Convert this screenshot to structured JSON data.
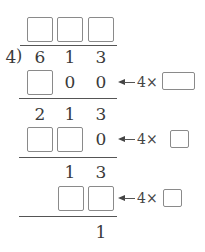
{
  "divisor": "4",
  "dividend": [
    "6",
    "1",
    "3"
  ],
  "quotient_blanks": [
    "",
    "",
    ""
  ],
  "steps": [
    {
      "product": [
        {
          "type": "blank"
        },
        {
          "type": "digit",
          "value": "0"
        },
        {
          "type": "digit",
          "value": "0"
        }
      ],
      "multiplier_label": "4×",
      "remainder": [
        "2",
        "1",
        "3"
      ]
    },
    {
      "product": [
        {
          "type": "blank"
        },
        {
          "type": "blank"
        },
        {
          "type": "digit",
          "value": "0"
        }
      ],
      "multiplier_label": "4×",
      "remainder": [
        "",
        "1",
        "3"
      ]
    },
    {
      "product": [
        {
          "type": "none"
        },
        {
          "type": "blank"
        },
        {
          "type": "blank"
        }
      ],
      "multiplier_label": "4×",
      "remainder": [
        "",
        "",
        "1"
      ]
    }
  ],
  "labels": {
    "divisor": "4",
    "d0": "6",
    "d1": "1",
    "d2": "3",
    "s1_p1": "0",
    "s1_p2": "0",
    "s1_r0": "2",
    "s1_r1": "1",
    "s1_r2": "3",
    "s2_p2": "0",
    "s2_r1": "1",
    "s2_r2": "3",
    "s3_r2": "1",
    "times1": "4×",
    "times2": "4×",
    "times3": "4×",
    "bracket": ")"
  }
}
